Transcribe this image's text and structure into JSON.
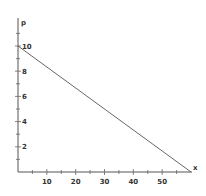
{
  "chart_data": {
    "type": "line",
    "title": "",
    "xlabel": "x",
    "ylabel": "p",
    "xlim": [
      0,
      60
    ],
    "ylim": [
      0,
      11
    ],
    "x_ticks": [
      10,
      20,
      30,
      40,
      50
    ],
    "y_ticks": [
      2,
      4,
      6,
      8,
      10
    ],
    "x_tick_labels": [
      "10",
      "20",
      "30",
      "40",
      "50"
    ],
    "y_tick_labels": [
      "2",
      "4",
      "6",
      "8",
      "10"
    ],
    "grid": false,
    "legend": null,
    "series": [
      {
        "name": "demand line",
        "x": [
          0,
          60
        ],
        "y": [
          10,
          0
        ],
        "color": "#555555"
      }
    ]
  }
}
